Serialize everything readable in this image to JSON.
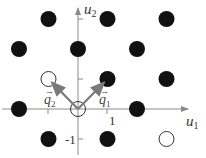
{
  "diagram": {
    "axes": {
      "x_label": "u",
      "x_sub": "1",
      "y_label": "u",
      "y_sub": "2",
      "tick_label_x": "1",
      "tick_label_y": "-1",
      "color": "#8a8a8a"
    },
    "vectors": [
      {
        "name": "q",
        "sub": "1",
        "from": [
          0,
          0
        ],
        "to": [
          1,
          1
        ]
      },
      {
        "name": "q",
        "sub": "2",
        "from": [
          0,
          0
        ],
        "to": [
          -1,
          1
        ]
      }
    ],
    "vector_arrow_glyph": "→",
    "filled_points": [
      [
        -1,
        3
      ],
      [
        1,
        3
      ],
      [
        3,
        3
      ],
      [
        -2,
        2
      ],
      [
        0,
        2
      ],
      [
        2,
        2
      ],
      [
        1,
        1
      ],
      [
        3,
        1
      ],
      [
        -2,
        0
      ],
      [
        2,
        0
      ],
      [
        -1,
        -1
      ],
      [
        1,
        -1
      ]
    ],
    "open_points": [
      [
        -1,
        1
      ],
      [
        0,
        0
      ],
      [
        3,
        -1
      ]
    ],
    "colors": {
      "filled": "#111111",
      "open_stroke": "#333333",
      "vector": "#7a7a7a",
      "axis": "#8a8a8a"
    }
  }
}
